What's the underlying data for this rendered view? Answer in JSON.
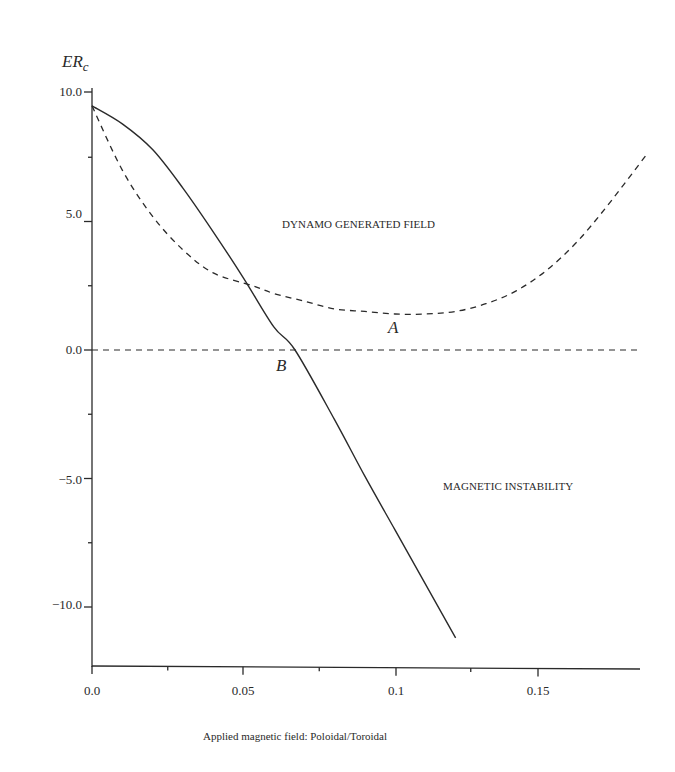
{
  "chart_data": {
    "type": "line",
    "title": "",
    "ylabel": "ER",
    "ylabel_subscript": "c",
    "xlabel": "Applied magnetic field: Poloidal/Toroidal",
    "xlim": [
      0.0,
      0.185
    ],
    "ylim": [
      -12.5,
      10.5
    ],
    "grid": false,
    "legend": "none",
    "x_ticks": [
      "0.0",
      "0.05",
      "0.1",
      "0.15"
    ],
    "y_ticks": [
      "10.0",
      "5.0",
      "0.0",
      "-5.0",
      "-10.0"
    ],
    "series": [
      {
        "name": "Magnetic instability boundary",
        "style": "solid",
        "x": [
          0.0,
          0.01,
          0.02,
          0.03,
          0.04,
          0.05,
          0.06,
          0.067,
          0.08,
          0.09,
          0.1,
          0.11,
          0.12
        ],
        "y": [
          9.5,
          8.8,
          7.8,
          6.3,
          4.6,
          2.8,
          0.9,
          0.0,
          -2.7,
          -4.9,
          -7.0,
          -9.1,
          -11.2
        ]
      },
      {
        "name": "Dynamo generated field boundary",
        "style": "dashed",
        "x": [
          0.0,
          0.01,
          0.02,
          0.03,
          0.04,
          0.053,
          0.06,
          0.07,
          0.08,
          0.09,
          0.1,
          0.11,
          0.12,
          0.13,
          0.14,
          0.15,
          0.16,
          0.17,
          0.183
        ],
        "y": [
          9.5,
          7.0,
          5.2,
          3.9,
          3.0,
          2.5,
          2.2,
          1.9,
          1.6,
          1.5,
          1.4,
          1.4,
          1.5,
          1.8,
          2.3,
          3.1,
          4.2,
          5.6,
          7.6
        ]
      },
      {
        "name": "Zero line",
        "style": "dashed",
        "x": [
          0.0,
          0.18
        ],
        "y": [
          0.0,
          0.0
        ]
      }
    ],
    "annotations": [
      {
        "text": "DYNAMO GENERATED FIELD",
        "x": 0.095,
        "y": 4.8
      },
      {
        "text": "MAGNETIC INSTABILITY",
        "x": 0.145,
        "y": -5.3
      },
      {
        "text": "A",
        "x": 0.1,
        "y": 0.5
      },
      {
        "text": "B",
        "x": 0.062,
        "y": -0.6
      }
    ]
  },
  "labels": {
    "y_title": "ER",
    "y_title_sub": "c",
    "x_title": "Applied magnetic field: Poloidal/Toroidal",
    "region_top": "DYNAMO GENERATED FIELD",
    "region_bottom": "MAGNETIC INSTABILITY",
    "point_a": "A",
    "point_b": "B",
    "xticks": [
      "0.0",
      "0.05",
      "0.1",
      "0.15"
    ],
    "yticks": [
      "10.0",
      "5.0",
      "0.0",
      "−5.0",
      "−10.0"
    ]
  },
  "colors": {
    "ink": "#2a2a2a",
    "background": "#ffffff"
  }
}
